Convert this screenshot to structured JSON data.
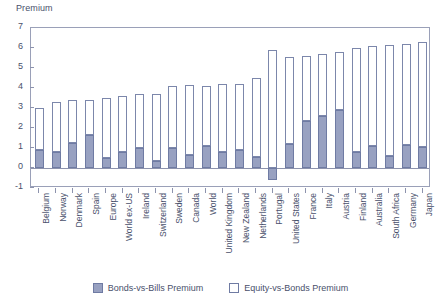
{
  "chart_data": {
    "type": "bar",
    "title": "",
    "ylabel": "Premium",
    "xlabel": "",
    "stacked": true,
    "ylim": [
      -1,
      7
    ],
    "yticks": [
      -1,
      0,
      1,
      2,
      3,
      4,
      5,
      6,
      7
    ],
    "ytick_labels": [
      "-1",
      "0",
      "1",
      "2",
      "3",
      "4",
      "5",
      "6",
      "7"
    ],
    "grid": false,
    "legend_position": "bottom-center",
    "legend": [
      "Bonds-vs-Bills Premium",
      "Equity-vs-Bonds Premium"
    ],
    "colors": {
      "bonds_vs_bills": "#98a1c1",
      "equity_vs_bonds": "#ffffff",
      "outline": "#6f7ba3",
      "axis": "#8d93ad",
      "text": "#49506b"
    },
    "categories": [
      "Belgium",
      "Norway",
      "Denmark",
      "Spain",
      "Europe",
      "World ex-US",
      "Ireland",
      "Switzerland",
      "Sweden",
      "Canada",
      "World",
      "United Kingdom",
      "New Zealand",
      "Netherlands",
      "Portugal",
      "United States",
      "France",
      "Italy",
      "Austria",
      "Finland",
      "Australia",
      "South Africa",
      "Germany",
      "Japan"
    ],
    "series": [
      {
        "name": "Bonds-vs-Bills Premium",
        "values": [
          0.9,
          0.8,
          1.25,
          1.65,
          0.5,
          0.8,
          1.0,
          0.35,
          1.0,
          0.65,
          1.1,
          0.8,
          0.9,
          0.55,
          -0.6,
          1.2,
          2.35,
          2.6,
          2.9,
          0.8,
          1.1,
          0.6,
          1.15,
          1.05
        ]
      },
      {
        "name": "Equity-vs-Bonds Premium",
        "values": [
          2.1,
          2.5,
          2.15,
          1.75,
          3.0,
          2.8,
          2.7,
          3.35,
          3.1,
          3.5,
          3.0,
          3.4,
          3.3,
          3.95,
          5.9,
          4.35,
          3.25,
          3.1,
          2.9,
          5.2,
          5.0,
          5.55,
          5.05,
          5.25
        ]
      }
    ],
    "totals": [
      3.0,
      3.3,
      3.4,
      3.4,
      3.5,
      3.6,
      3.7,
      3.7,
      4.1,
      4.15,
      4.1,
      4.2,
      4.2,
      4.5,
      5.3,
      5.55,
      5.6,
      5.7,
      5.8,
      6.0,
      6.1,
      6.15,
      6.2,
      6.3
    ]
  },
  "legend": {
    "items": [
      {
        "label": "Bonds-vs-Bills Premium",
        "swatch": "filled"
      },
      {
        "label": "Equity-vs-Bonds Premium",
        "swatch": "hollow"
      }
    ]
  }
}
